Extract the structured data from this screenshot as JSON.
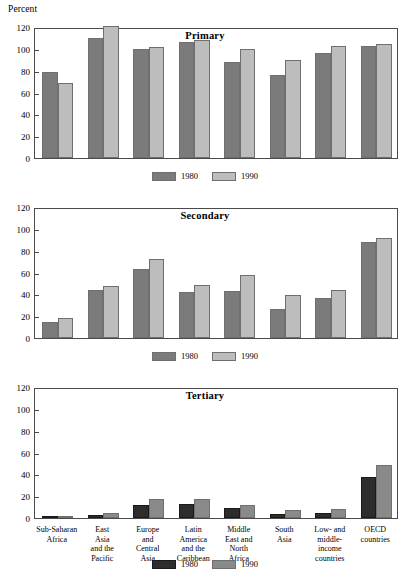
{
  "axis": {
    "unit_label": "Percent",
    "yticks": [
      0,
      20,
      40,
      60,
      80,
      100,
      120
    ],
    "ymin": 0,
    "ymax": 120
  },
  "legend": {
    "series_1980": "1980",
    "series_1990": "1990"
  },
  "colors": {
    "bar_1980_light": "#7b7b7b",
    "bar_1990_light": "#bdbdbd",
    "bar_1980_dark": "#2d2d2d",
    "bar_1990_dark": "#8a8a8a",
    "frame": "#4a4a4a"
  },
  "categories": [
    "Sub-Saharan Africa",
    "East Asia and the Pacific",
    "Europe and Central Asia",
    "Latin America and the Caribbean",
    "Middle East and North Africa",
    "South Asia",
    "Low- and middle-income countries",
    "OECD countries"
  ],
  "category_lines": [
    [
      "Sub-Saharan",
      "Africa"
    ],
    [
      "East",
      "Asia",
      "and the",
      "Pacific"
    ],
    [
      "Europe",
      "and",
      "Central",
      "Asia"
    ],
    [
      "Latin",
      "America",
      "and the",
      "Caribbean"
    ],
    [
      "Middle",
      "East and",
      "North",
      "Africa"
    ],
    [
      "South",
      "Asia"
    ],
    [
      "Low- and",
      "middle-",
      "income",
      "countries"
    ],
    [
      "OECD",
      "countries"
    ]
  ],
  "chart_data": [
    {
      "type": "bar",
      "title": "Primary",
      "xlabel": "",
      "ylabel": "Percent",
      "ylim": [
        0,
        120
      ],
      "yticks": [
        0,
        20,
        40,
        60,
        80,
        100,
        120
      ],
      "grid": false,
      "legend_position": "bottom",
      "categories": [
        "Sub-Saharan Africa",
        "East Asia and the Pacific",
        "Europe and Central Asia",
        "Latin America and the Caribbean",
        "Middle East and North Africa",
        "South Asia",
        "Low- and middle-income countries",
        "OECD countries"
      ],
      "series": [
        {
          "name": "1980",
          "values": [
            79,
            110,
            100,
            106,
            88,
            76,
            96,
            103
          ]
        },
        {
          "name": "1990",
          "values": [
            69,
            121,
            102,
            108,
            100,
            90,
            103,
            104
          ]
        }
      ]
    },
    {
      "type": "bar",
      "title": "Secondary",
      "xlabel": "",
      "ylabel": "Percent",
      "ylim": [
        0,
        120
      ],
      "yticks": [
        0,
        20,
        40,
        60,
        80,
        100,
        120
      ],
      "grid": false,
      "legend_position": "bottom",
      "categories": [
        "Sub-Saharan Africa",
        "East Asia and the Pacific",
        "Europe and Central Asia",
        "Latin America and the Caribbean",
        "Middle East and North Africa",
        "South Asia",
        "Low- and middle-income countries",
        "OECD countries"
      ],
      "series": [
        {
          "name": "1980",
          "values": [
            15,
            44,
            63,
            42,
            43,
            27,
            37,
            88
          ]
        },
        {
          "name": "1990",
          "values": [
            18,
            48,
            72,
            49,
            58,
            39,
            44,
            92
          ]
        }
      ]
    },
    {
      "type": "bar",
      "title": "Tertiary",
      "xlabel": "",
      "ylabel": "Percent",
      "ylim": [
        0,
        120
      ],
      "yticks": [
        0,
        20,
        40,
        60,
        80,
        100,
        120
      ],
      "grid": false,
      "legend_position": "bottom",
      "categories": [
        "Sub-Saharan Africa",
        "East Asia and the Pacific",
        "Europe and Central Asia",
        "Latin America and the Caribbean",
        "Middle East and North Africa",
        "South Asia",
        "Low- and middle-income countries",
        "OECD countries"
      ],
      "series": [
        {
          "name": "1980",
          "values": [
            1,
            3,
            12,
            13,
            9,
            4,
            5,
            38
          ]
        },
        {
          "name": "1990",
          "values": [
            2,
            5,
            17,
            17,
            12,
            7,
            8,
            49
          ]
        }
      ]
    }
  ]
}
